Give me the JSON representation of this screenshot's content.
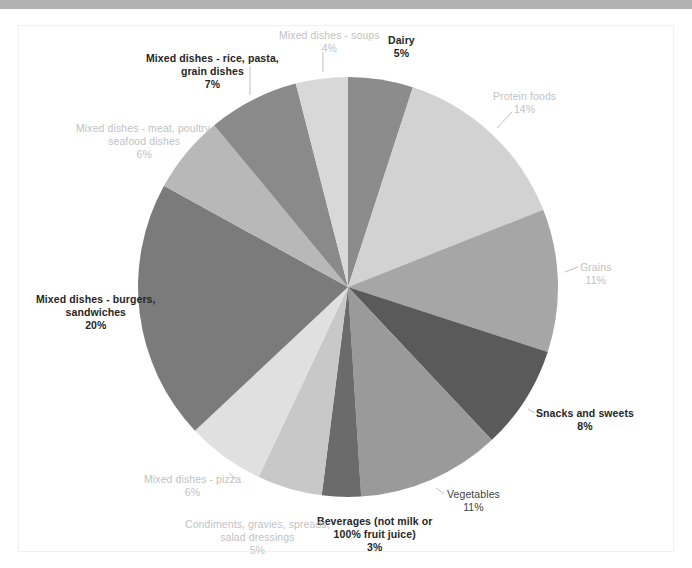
{
  "document": {
    "background_color": "#ffffff",
    "top_bar_color": "#b2b2b2",
    "frame_border_color": "#f0f0f0"
  },
  "chart_data": {
    "type": "pie",
    "title": "",
    "subtitle": "",
    "xlabel": "",
    "ylabel": "",
    "legend_position": "none",
    "grid": false,
    "start_angle_deg": 0,
    "direction": "clockwise",
    "units": "percent",
    "total": 100,
    "categories": [
      "Dairy",
      "Protein foods",
      "Grains",
      "Snacks and sweets",
      "Vegetables",
      "Beverages (not milk or 100% fruit juice)",
      "Condiments, gravies, spreads, salad dressings",
      "Mixed dishes - pizza",
      "Mixed dishes - burgers, sandwiches",
      "Mixed dishes - meat, poultry, seafood dishes",
      "Mixed dishes - rice, pasta, grain dishes",
      "Mixed dishes - soups"
    ],
    "values": [
      5,
      14,
      11,
      8,
      11,
      3,
      5,
      6,
      20,
      6,
      7,
      4
    ],
    "colors": [
      "#8c8c8c",
      "#d2d2d2",
      "#a6a6a6",
      "#5a5a5a",
      "#9a9a9a",
      "#6b6b6b",
      "#c8c8c8",
      "#e0e0e0",
      "#7b7b7b",
      "#b8b8b8",
      "#8a8a8a",
      "#d8d8d8"
    ],
    "slices": [
      {
        "label": "Dairy",
        "pct_text": "5%",
        "value": 5,
        "color": "#8c8c8c",
        "label_style": "dark",
        "label_lines": [
          "Dairy"
        ],
        "label_x": 388,
        "label_y": 34,
        "leader": false
      },
      {
        "label": "Protein foods",
        "pct_text": "14%",
        "value": 14,
        "color": "#d2d2d2",
        "label_style": "light",
        "label_lines": [
          "Protein foods"
        ],
        "label_x": 493,
        "label_y": 90,
        "leader": true,
        "leader_path": "M 512 112 L 497 128"
      },
      {
        "label": "Grains",
        "pct_text": "11%",
        "value": 11,
        "color": "#a6a6a6",
        "label_style": "light",
        "label_lines": [
          "Grains"
        ],
        "label_x": 580,
        "label_y": 261,
        "leader": true,
        "leader_path": "M 578 267 L 565 272"
      },
      {
        "label": "Snacks and sweets",
        "pct_text": "8%",
        "value": 8,
        "color": "#5a5a5a",
        "label_style": "dark",
        "label_lines": [
          "Snacks and sweets"
        ],
        "label_x": 536,
        "label_y": 407,
        "leader": true,
        "leader_path": "M 535 413 L 528 409"
      },
      {
        "label": "Vegetables",
        "pct_text": "11%",
        "value": 11,
        "color": "#9a9a9a",
        "label_style": "mid",
        "label_lines": [
          "Vegetables"
        ],
        "label_x": 447,
        "label_y": 488,
        "leader": true,
        "leader_path": "M 444 494 L 436 488"
      },
      {
        "label": "Beverages (not milk or 100% fruit juice)",
        "pct_text": "3%",
        "value": 3,
        "color": "#6b6b6b",
        "label_style": "dark",
        "label_lines": [
          "Beverages (not milk or",
          "100% fruit juice)"
        ],
        "label_x": 317,
        "label_y": 515,
        "leader": false
      },
      {
        "label": "Condiments, gravies, spreads, salad dressings",
        "pct_text": "5%",
        "value": 5,
        "color": "#c8c8c8",
        "label_style": "light",
        "label_lines": [
          "Condiments, gravies, spreads,",
          "salad dressings"
        ],
        "label_x": 185,
        "label_y": 518,
        "leader": false
      },
      {
        "label": "Mixed dishes - pizza",
        "pct_text": "6%",
        "value": 6,
        "color": "#e0e0e0",
        "label_style": "light",
        "label_lines": [
          "Mixed dishes - pizza"
        ],
        "label_x": 144,
        "label_y": 473,
        "leader": true,
        "leader_path": "M 229 473 L 236 479"
      },
      {
        "label": "Mixed dishes - burgers, sandwiches",
        "pct_text": "20%",
        "value": 20,
        "color": "#7b7b7b",
        "label_style": "dark",
        "label_lines": [
          "Mixed dishes - burgers,",
          "sandwiches"
        ],
        "label_x": 36,
        "label_y": 293,
        "leader": false
      },
      {
        "label": "Mixed dishes - meat, poultry, seafood dishes",
        "pct_text": "6%",
        "value": 6,
        "color": "#b8b8b8",
        "label_style": "light",
        "label_lines": [
          "Mixed dishes - meat, poultry,",
          "seafood dishes"
        ],
        "label_x": 76,
        "label_y": 122,
        "leader": false
      },
      {
        "label": "Mixed dishes - rice, pasta, grain dishes",
        "pct_text": "7%",
        "value": 7,
        "color": "#8a8a8a",
        "label_style": "dark",
        "label_lines": [
          "Mixed dishes - rice, pasta,",
          "grain dishes"
        ],
        "label_x": 146,
        "label_y": 52,
        "leader": true,
        "leader_path": "M 250 66 L 250 95"
      },
      {
        "label": "Mixed dishes - soups",
        "pct_text": "4%",
        "value": 4,
        "color": "#d8d8d8",
        "label_style": "light",
        "label_lines": [
          "Mixed dishes - soups"
        ],
        "label_x": 279,
        "label_y": 29,
        "leader": true,
        "leader_path": "M 323 52 L 323 72"
      }
    ],
    "geometry": {
      "center_x": 348,
      "center_y": 287,
      "radius": 210
    }
  }
}
